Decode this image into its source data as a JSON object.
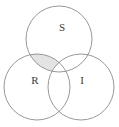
{
  "figure": {
    "name": "venn-diagram",
    "type": "three-set-venn",
    "background_color": "#ffffff",
    "stroke_color": "#8c8c8c",
    "label_color": "#3a3a3a",
    "width": 119,
    "height": 127
  },
  "sets": [
    {
      "id": "S",
      "label": "S",
      "position": "top",
      "center_x": 59,
      "center_y": 39,
      "radius": 33,
      "label_x": 62,
      "label_y": 28
    },
    {
      "id": "R",
      "label": "R",
      "position": "bottom-left",
      "center_x": 37,
      "center_y": 87,
      "radius": 33,
      "label_x": 35,
      "label_y": 81
    },
    {
      "id": "I",
      "label": "I",
      "position": "bottom-right",
      "center_x": 81,
      "center_y": 87,
      "radius": 33,
      "label_x": 82,
      "label_y": 81
    }
  ],
  "shaded_regions": [
    {
      "id": "S-and-R-not-I",
      "description": "intersection of S and R excluding I",
      "fill_color": "#e3e3e3",
      "outline_color": "#8c8c8c"
    }
  ]
}
